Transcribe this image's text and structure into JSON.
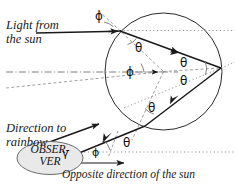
{
  "figure": {
    "background": "#ffffff",
    "stroke_color": "#1a1a1a",
    "guide_color": "#8a8a8a",
    "observer_fill": "#e8e8e8"
  },
  "labels": {
    "light_from_sun_line1": "Light from",
    "light_from_sun_line2": "the sun",
    "direction_to_rainbow_line1": "Direction to",
    "direction_to_rainbow_line2": "rainbow",
    "opposite_direction": "Opposite direction of the sun",
    "observer_line1": "OBSER-",
    "observer_line2": "VER"
  },
  "angles": [
    {
      "id": "phi-incidence",
      "symbol": "ϕ",
      "x": 95,
      "y": 9
    },
    {
      "id": "theta-refraction",
      "symbol": "θ",
      "x": 135,
      "y": 41
    },
    {
      "id": "phi-center",
      "symbol": "ϕ",
      "x": 126,
      "y": 65
    },
    {
      "id": "theta-reflect-in",
      "symbol": "θ",
      "x": 180,
      "y": 56
    },
    {
      "id": "theta-reflect-out",
      "symbol": "θ",
      "x": 180,
      "y": 74
    },
    {
      "id": "theta-exit-inner",
      "symbol": "θ",
      "x": 148,
      "y": 101
    },
    {
      "id": "theta-exit",
      "symbol": "θ",
      "x": 123,
      "y": 136
    },
    {
      "id": "phi-exit",
      "symbol": "ϕ",
      "x": 92,
      "y": 146
    },
    {
      "id": "gamma-rainbow",
      "symbol": "γ",
      "x": 62,
      "y": 150
    }
  ],
  "geometry": {
    "drop_circle": {
      "cx": 163.5,
      "cy": 71.5,
      "r": 58.5
    },
    "entry_point": {
      "x": 120,
      "y": 31
    },
    "reflection_point": {
      "x": 221,
      "y": 68
    },
    "exit_point": {
      "x": 145,
      "y": 126
    },
    "incoming_ray": {
      "x1": 36,
      "y1": 33,
      "x2": 120,
      "y2": 31
    },
    "outgoing_ray": {
      "x1": 145,
      "y1": 126,
      "x2": 55,
      "y2": 163
    },
    "rainbow_arrow": {
      "x1": 33,
      "y1": 148,
      "x2": 101,
      "y2": 123
    },
    "opposite_arrow": {
      "x1": 66,
      "y1": 163,
      "x2": 126,
      "y2": 163
    }
  }
}
